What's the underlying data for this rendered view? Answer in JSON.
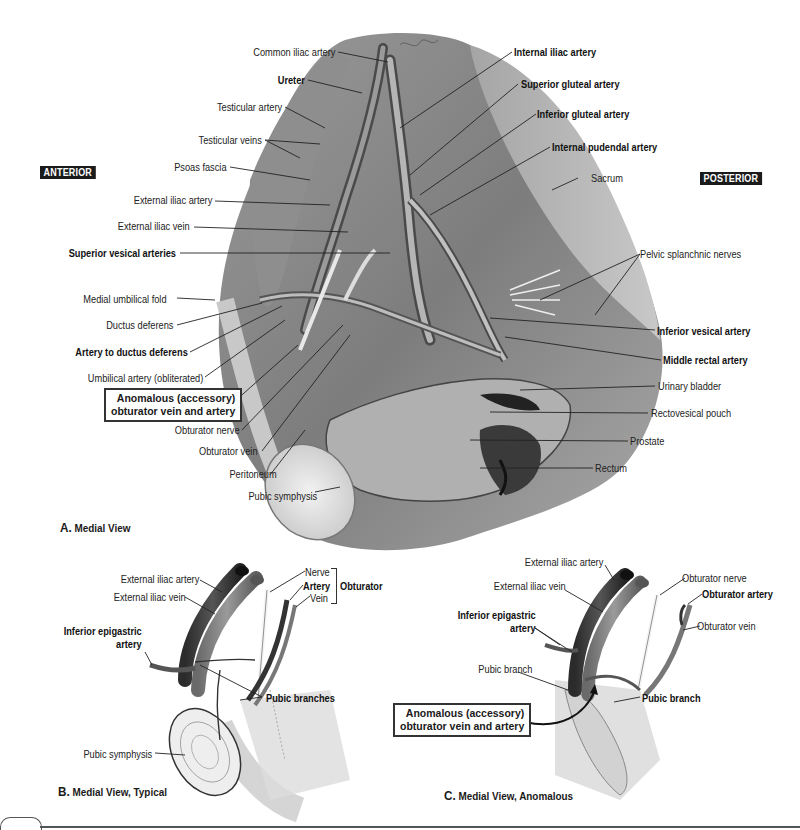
{
  "figure": {
    "orientation": {
      "anterior": "ANTERIOR",
      "posterior": "POSTERIOR"
    },
    "panel_a": {
      "caption_letter": "A.",
      "caption_text": "Medial View",
      "labels_left": [
        "Common iliac artery",
        "Ureter",
        "Testicular artery",
        "Testicular veins",
        "Psoas fascia",
        "External iliac artery",
        "External iliac vein",
        "Superior vesical arteries",
        "Medial umbilical fold",
        "Ductus deferens",
        "Artery to ductus deferens",
        "Umbilical artery (obliterated)",
        "Obturator nerve",
        "Obturator vein",
        "Peritoneum",
        "Pubic symphysis"
      ],
      "boxed_label": [
        "Anomalous (accessory)",
        "obturator vein and artery"
      ],
      "labels_right": [
        "Internal iliac artery",
        "Superior gluteal artery",
        "Inferior gluteal artery",
        "Internal pudendal artery",
        "Sacrum",
        "Pelvic splanchnic nerves",
        "Inferior vesical artery",
        "Middle rectal artery",
        "Urinary bladder",
        "Rectovesical pouch",
        "Prostate",
        "Rectum"
      ]
    },
    "panel_b": {
      "caption_letter": "B.",
      "caption_text": "Medial View, Typical",
      "labels": {
        "external_iliac_artery": "External iliac artery",
        "external_iliac_vein": "External iliac vein",
        "inferior_epigastric_artery": [
          "Inferior epigastric",
          "artery"
        ],
        "nerve": "Nerve",
        "artery": "Artery",
        "vein": "Vein",
        "obturator_group": "Obturator",
        "pubic_branches": "Pubic branches",
        "pubic_symphysis": "Pubic symphysis"
      }
    },
    "panel_c": {
      "caption_letter": "C.",
      "caption_text": "Medial View, Anomalous",
      "labels": {
        "external_iliac_artery": "External iliac artery",
        "external_iliac_vein": "External iliac vein",
        "obturator_nerve": "Obturator nerve",
        "obturator_artery": "Obturator artery",
        "obturator_vein": "Obturator vein",
        "inferior_epigastric_artery": [
          "Inferior epigastric",
          "artery"
        ],
        "pubic_branch_left": "Pubic branch",
        "pubic_branch_right": "Pubic branch",
        "boxed_label": [
          "Anomalous (accessory)",
          "obturator vein and artery"
        ]
      }
    }
  }
}
